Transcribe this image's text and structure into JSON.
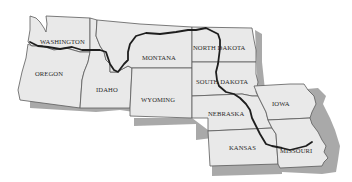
{
  "map": {
    "title": "",
    "fill_color": "#e9e9e9",
    "border_color": "#5a5a5a",
    "shadow_color": "#9a9a9a",
    "river_color": "#1e1e1e",
    "states": [
      {
        "id": "washington",
        "label": "WASHINGTON"
      },
      {
        "id": "oregon",
        "label": "OREGON"
      },
      {
        "id": "idaho",
        "label": "IDAHO"
      },
      {
        "id": "montana",
        "label": "MONTANA"
      },
      {
        "id": "wyoming",
        "label": "WYOMING"
      },
      {
        "id": "north-dakota",
        "label": "NORTH DAKOTA"
      },
      {
        "id": "south-dakota",
        "label": "SOUTH DAKOTA"
      },
      {
        "id": "nebraska",
        "label": "NEBRASKA"
      },
      {
        "id": "kansas",
        "label": "KANSAS"
      },
      {
        "id": "iowa",
        "label": "IOWA"
      },
      {
        "id": "missouri",
        "label": "MISSOURI"
      }
    ],
    "route": "thick dark line tracing Lewis and Clark route along Missouri and Columbia rivers"
  }
}
